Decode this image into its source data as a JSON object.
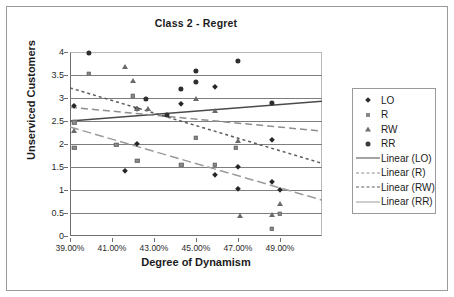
{
  "chart_data": {
    "type": "scatter",
    "title": "Class 2 - Regret",
    "xlabel": "Degree of Dynamism",
    "ylabel": "Unserviced Customers",
    "xlim": [
      39,
      51
    ],
    "ylim": [
      0,
      4
    ],
    "grid": true,
    "legend_position": "right",
    "xticks": [
      "39.00%",
      "41.00%",
      "43.00%",
      "45.00%",
      "47.00%",
      "49.00%"
    ],
    "xtick_values": [
      39,
      41,
      43,
      45,
      47,
      49
    ],
    "yticks": [
      "0",
      "0.5",
      "1",
      "1.5",
      "2",
      "2.5",
      "3",
      "3.5",
      "4"
    ],
    "ytick_values": [
      0,
      0.5,
      1,
      1.5,
      2,
      2.5,
      3,
      3.5,
      4
    ],
    "series": [
      {
        "name": "LO",
        "marker": "diamond",
        "color": "#262626",
        "points": [
          [
            39.2,
            2.83
          ],
          [
            41.6,
            1.42
          ],
          [
            42.2,
            2.0
          ],
          [
            42.2,
            2.76
          ],
          [
            44.3,
            2.87
          ],
          [
            45.9,
            3.25
          ],
          [
            45.9,
            1.33
          ],
          [
            47.0,
            1.5
          ],
          [
            47.0,
            1.03
          ],
          [
            48.6,
            2.09
          ],
          [
            48.6,
            1.17
          ],
          [
            49.0,
            1.0
          ]
        ]
      },
      {
        "name": "R",
        "marker": "square",
        "color": "#8d8d8d",
        "points": [
          [
            39.2,
            2.47
          ],
          [
            39.2,
            1.92
          ],
          [
            39.9,
            3.52
          ],
          [
            41.2,
            1.99
          ],
          [
            42.0,
            3.04
          ],
          [
            42.2,
            1.64
          ],
          [
            44.3,
            1.55
          ],
          [
            45.0,
            2.13
          ],
          [
            45.9,
            1.55
          ],
          [
            46.9,
            1.92
          ],
          [
            48.6,
            0.15
          ],
          [
            49.0,
            0.48
          ]
        ]
      },
      {
        "name": "RW",
        "marker": "triangle",
        "color": "#6a6a6a",
        "points": [
          [
            39.2,
            2.28
          ],
          [
            41.6,
            3.68
          ],
          [
            42.0,
            3.37
          ],
          [
            42.2,
            2.76
          ],
          [
            42.7,
            2.77
          ],
          [
            45.0,
            2.97
          ],
          [
            45.9,
            2.72
          ],
          [
            47.0,
            2.07
          ],
          [
            47.1,
            0.44
          ],
          [
            48.6,
            0.46
          ],
          [
            49.0,
            0.69
          ]
        ]
      },
      {
        "name": "RR",
        "marker": "circle",
        "color": "#2f2f2f",
        "points": [
          [
            39.9,
            3.99
          ],
          [
            42.6,
            2.99
          ],
          [
            44.3,
            3.19
          ],
          [
            45.0,
            3.59
          ],
          [
            45.0,
            3.35
          ],
          [
            47.0,
            3.8
          ],
          [
            48.6,
            2.89
          ],
          [
            43.6,
            2.63
          ]
        ]
      }
    ],
    "trendlines": [
      {
        "name": "Linear (LO)",
        "style": "solid",
        "color": "#4a4a4a",
        "x0": 39,
        "y0": 2.5,
        "x1": 51,
        "y1": 2.93
      },
      {
        "name": "Linear (R)",
        "style": "dash",
        "color": "#8f8f8f",
        "x0": 39,
        "y0": 2.8,
        "x1": 51,
        "y1": 2.28
      },
      {
        "name": "Linear (RW)",
        "style": "dot",
        "color": "#5c5c5c",
        "x0": 39,
        "y0": 3.22,
        "x1": 51,
        "y1": 1.58
      },
      {
        "name": "Linear (RR)",
        "style": "dash-long",
        "color": "#9b9b9b",
        "x0": 39,
        "y0": 2.37,
        "x1": 51,
        "y1": 0.78
      }
    ],
    "legend": [
      {
        "label": "LO",
        "key": "marker-diamond"
      },
      {
        "label": "R",
        "key": "marker-square"
      },
      {
        "label": "RW",
        "key": "marker-triangle"
      },
      {
        "label": "RR",
        "key": "marker-circle"
      },
      {
        "label": "Linear (LO)",
        "key": "line-solid"
      },
      {
        "label": "Linear (R)",
        "key": "line-dash"
      },
      {
        "label": "Linear (RW)",
        "key": "line-dot"
      },
      {
        "label": "Linear (RR)",
        "key": "line-dashdot"
      }
    ]
  }
}
